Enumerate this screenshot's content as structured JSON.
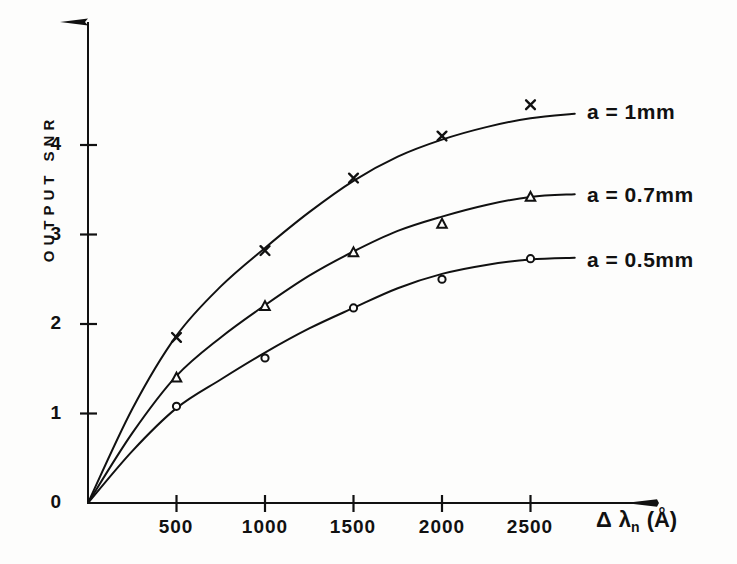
{
  "chart_data": {
    "type": "line",
    "title": "",
    "xlabel": "Δ λ_n (Å)",
    "ylabel": "OUTPUT SNR",
    "xlabel_parts": {
      "delta": "Δ",
      "lambda": "λ",
      "sub": "n",
      "unit": "(Å)"
    },
    "xlim": [
      0,
      2750
    ],
    "ylim": [
      0,
      4.9
    ],
    "grid": false,
    "legend_position": "right-of-curves",
    "xticks": [
      500,
      1000,
      1500,
      2000,
      2500
    ],
    "xtick_labels": [
      "500",
      "1000",
      "1500",
      "2000",
      "2500"
    ],
    "yticks": [
      0,
      1,
      2,
      3,
      4
    ],
    "ytick_labels": [
      "0",
      "1",
      "2",
      "3",
      "4"
    ],
    "x": [
      500,
      1000,
      1500,
      2000,
      2500
    ],
    "series": [
      {
        "name": "a = 1mm",
        "marker": "x-cross",
        "values": [
          1.85,
          2.82,
          3.63,
          4.1,
          4.45
        ],
        "curve": [
          [
            0,
            0
          ],
          [
            250,
            1.05
          ],
          [
            500,
            1.87
          ],
          [
            750,
            2.42
          ],
          [
            1000,
            2.85
          ],
          [
            1250,
            3.25
          ],
          [
            1500,
            3.6
          ],
          [
            1750,
            3.87
          ],
          [
            2000,
            4.06
          ],
          [
            2250,
            4.2
          ],
          [
            2500,
            4.3
          ],
          [
            2750,
            4.35
          ]
        ]
      },
      {
        "name": "a = 0.7mm",
        "marker": "triangle",
        "values": [
          1.4,
          2.2,
          2.8,
          3.12,
          3.42
        ],
        "curve": [
          [
            0,
            0
          ],
          [
            250,
            0.78
          ],
          [
            500,
            1.42
          ],
          [
            750,
            1.85
          ],
          [
            1000,
            2.21
          ],
          [
            1250,
            2.54
          ],
          [
            1500,
            2.81
          ],
          [
            1750,
            3.04
          ],
          [
            2000,
            3.2
          ],
          [
            2250,
            3.33
          ],
          [
            2500,
            3.42
          ],
          [
            2750,
            3.45
          ]
        ]
      },
      {
        "name": "a = 0.5mm",
        "marker": "circle",
        "values": [
          1.08,
          1.62,
          2.18,
          2.5,
          2.73
        ],
        "curve": [
          [
            0,
            0
          ],
          [
            250,
            0.58
          ],
          [
            500,
            1.06
          ],
          [
            750,
            1.38
          ],
          [
            1000,
            1.68
          ],
          [
            1250,
            1.95
          ],
          [
            1500,
            2.18
          ],
          [
            1750,
            2.4
          ],
          [
            2000,
            2.56
          ],
          [
            2250,
            2.66
          ],
          [
            2500,
            2.72
          ],
          [
            2750,
            2.74
          ]
        ]
      }
    ]
  },
  "axes": {
    "y_axis_label": "OUTPUT SNR",
    "x_axis_label_text": "Δ λₙ (Å)"
  },
  "series_labels": [
    "a = 1mm",
    "a = 0.7mm",
    "a = 0.5mm"
  ],
  "colors": {
    "ink": "#111111",
    "background": "#fdfdfc"
  }
}
